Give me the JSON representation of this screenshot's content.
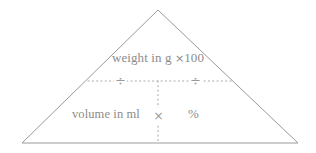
{
  "diagram": {
    "type": "formula-triangle",
    "shape": {
      "name": "triangle",
      "apex": {
        "x": 158,
        "y": 10
      },
      "base_left": {
        "x": 22,
        "y": 143
      },
      "base_right": {
        "x": 298,
        "y": 143
      },
      "stroke_color": "#9a9a9a",
      "fill_color": "#ffffff"
    },
    "dividers": {
      "horizontal": {
        "style": "dotted",
        "y": 81,
        "x_start": 88,
        "x_end": 232,
        "color": "#a8a8a8"
      },
      "vertical": {
        "style": "dotted",
        "x": 158,
        "y_start": 81,
        "y_end": 143,
        "color": "#a8a8a8"
      }
    },
    "numerator": {
      "text": "weight in g ×100",
      "text_prefix": "weight in g ",
      "multiply_symbol": "×",
      "factor": "100"
    },
    "denominator": {
      "text": "volume in ml"
    },
    "result": {
      "text": "%"
    },
    "operators": {
      "divide_left": "÷",
      "divide_right": "÷",
      "multiply_center": "×"
    },
    "text_color": "#8c8c8c"
  }
}
